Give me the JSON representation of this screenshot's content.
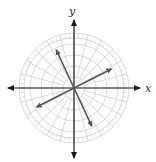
{
  "diagram": {
    "type": "polar-grid-with-vectors",
    "axes": {
      "x_label": "x",
      "y_label": "y"
    },
    "colors": {
      "grid": "#cfcfcf",
      "axis": "#1a1a1a",
      "vector": "#555555",
      "label": "#333333"
    },
    "grid": {
      "rings": 5,
      "spokes_deg": 15,
      "outer_ticks_deg": 5
    },
    "vectors": [
      {
        "name": "vector-upper-left",
        "angle_deg": 115
      },
      {
        "name": "vector-upper-right",
        "angle_deg": 27
      },
      {
        "name": "vector-lower-left",
        "angle_deg": 207
      },
      {
        "name": "vector-lower-right",
        "angle_deg": 295
      }
    ]
  }
}
